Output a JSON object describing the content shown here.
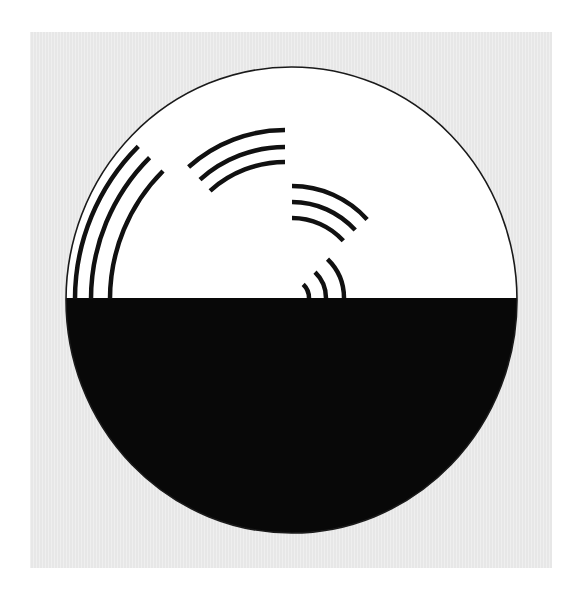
{
  "figure": {
    "title": "",
    "panel_color": "#e7e7e7",
    "disc": {
      "cx": 291.5,
      "cy": 300,
      "rx": 225.5,
      "ry": 233,
      "top_fill": "#ffffff",
      "bottom_fill": "#080808",
      "outline": "#1a1a1a",
      "split_y": 298
    },
    "stroke_color": "#111111",
    "stroke_width": 4.5,
    "arc_groups": [
      {
        "name": "upper-left-group",
        "cx": 291,
        "cy": 299,
        "radii": [
          216,
          200,
          181
        ],
        "start_deg": 180,
        "end_deg": 225
      },
      {
        "name": "upper-center-group",
        "cx": 285,
        "cy": 274,
        "radii": [
          144,
          127,
          112
        ],
        "start_deg": 270,
        "end_deg": 228
      },
      {
        "name": "center-right-group",
        "cx": 292,
        "cy": 287,
        "radii": [
          101,
          85,
          69
        ],
        "start_deg": 270,
        "end_deg": 318
      },
      {
        "name": "lower-small-group",
        "cx": 290,
        "cy": 298,
        "radii": [
          54,
          36,
          19
        ],
        "start_deg": 0,
        "end_deg": -46
      }
    ]
  }
}
